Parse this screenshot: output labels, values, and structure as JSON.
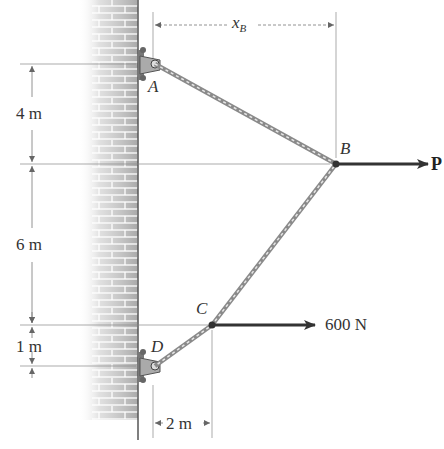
{
  "diagram": {
    "points": {
      "A": {
        "label": "A",
        "x": 155,
        "y": 64
      },
      "B": {
        "label": "B",
        "x": 336,
        "y": 164
      },
      "C": {
        "label": "C",
        "x": 212,
        "y": 325
      },
      "D": {
        "label": "D",
        "x": 155,
        "y": 366
      }
    },
    "dimensions": {
      "xB": {
        "label": "x",
        "subscript": "B"
      },
      "AB_vertical": {
        "label": "4 m"
      },
      "BC_vertical": {
        "label": "6 m"
      },
      "CD_vertical": {
        "label": "1 m"
      },
      "DC_horizontal": {
        "label": "2 m"
      }
    },
    "forces": {
      "P": {
        "label": "P",
        "direction": "right"
      },
      "F600": {
        "label": "600 N",
        "direction": "right"
      }
    },
    "colors": {
      "cable": "#9a9a9a",
      "arrow": "#333333",
      "wall": "#b8b8b8",
      "dim_line": "#777777"
    }
  }
}
